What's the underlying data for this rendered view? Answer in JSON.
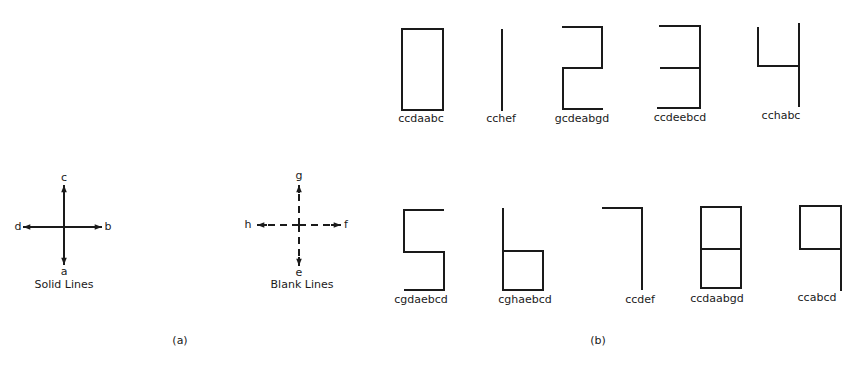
{
  "panel_a": {
    "label": "(a)",
    "solid": {
      "caption": "Solid Lines",
      "directions": {
        "down": "a",
        "right": "b",
        "up": "c",
        "left": "d"
      }
    },
    "blank": {
      "caption": "Blank Lines",
      "directions": {
        "down": "e",
        "right": "f",
        "up": "g",
        "left": "h"
      }
    }
  },
  "panel_b": {
    "label": "(b)",
    "digits": [
      {
        "digit": "0",
        "code": "ccdaabc"
      },
      {
        "digit": "1",
        "code": "cchef"
      },
      {
        "digit": "2",
        "code": "gcdeabgd"
      },
      {
        "digit": "3",
        "code": "ccdeebcd"
      },
      {
        "digit": "4",
        "code": "cchabc"
      },
      {
        "digit": "5",
        "code": "cgdaebcd"
      },
      {
        "digit": "6",
        "code": "cghaebcd"
      },
      {
        "digit": "7",
        "code": "ccdef"
      },
      {
        "digit": "8",
        "code": "ccdaabgd"
      },
      {
        "digit": "9",
        "code": "ccabcd"
      }
    ]
  },
  "colors": {
    "ink": "#1a1a1a",
    "background": "#ffffff"
  }
}
